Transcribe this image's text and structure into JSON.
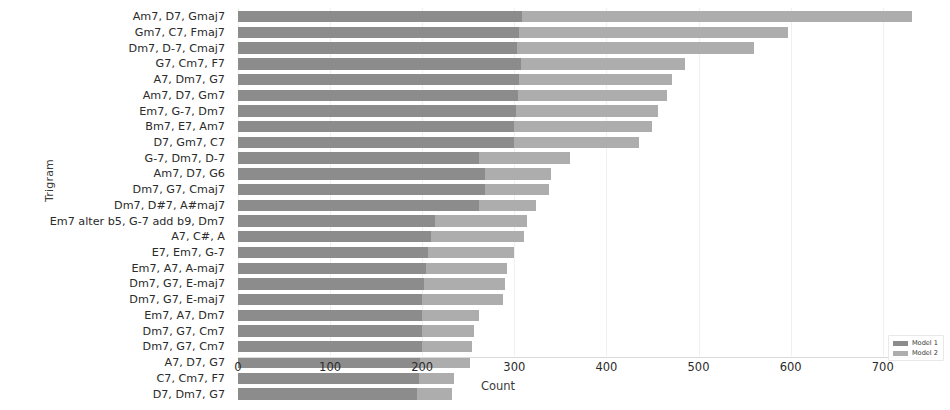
{
  "chart_data": {
    "type": "bar",
    "orientation": "horizontal",
    "stacked": true,
    "title": "",
    "xlabel": "Count",
    "ylabel": "Trigram",
    "xlim": [
      0,
      760
    ],
    "xticks": [
      0,
      100,
      200,
      300,
      400,
      500,
      600,
      700
    ],
    "xtick_labels": [
      "0",
      "100",
      "200",
      "300",
      "400",
      "500",
      "600",
      "700"
    ],
    "grid": true,
    "legend_position": "lower right",
    "categories": [
      "Am7, D7, Gmaj7",
      "Gm7, C7, Fmaj7",
      "Dm7, D-7, Cmaj7",
      "G7, Cm7, F7",
      "A7, Dm7, G7",
      "Am7, D7, Gm7",
      "Em7, G-7, Dm7",
      "Bm7, E7, Am7",
      "D7, Gm7, C7",
      "G-7, Dm7, D-7",
      "Am7, D7, G6",
      "Dm7, G7, Cmaj7",
      "Dm7, D#7, A#maj7",
      "Em7 alter b5, G-7 add b9, Dm7",
      "A7, C#, A",
      "E7, Em7, G-7",
      "Em7, A7, A-maj7",
      "Dm7, G7, E-maj7",
      "Dm7, G7, E-maj7",
      "Em7, A7, Dm7",
      "Dm7, G7, Cm7",
      "Dm7, G7, Cm7",
      "A7, D7, G7",
      "C7, Cm7, F7",
      "D7, Dm7, G7"
    ],
    "series": [
      {
        "name": "Model 1",
        "color": "#8c8c8c",
        "values": [
          308,
          305,
          303,
          307,
          305,
          304,
          302,
          300,
          300,
          262,
          268,
          268,
          262,
          214,
          210,
          206,
          204,
          202,
          200,
          200,
          200,
          200,
          198,
          196,
          194
        ]
      },
      {
        "name": "Model 2",
        "color": "#adadad",
        "values": [
          424,
          292,
          257,
          178,
          166,
          162,
          154,
          150,
          135,
          98,
          72,
          70,
          62,
          100,
          100,
          94,
          88,
          88,
          88,
          62,
          56,
          54,
          54,
          38,
          38
        ]
      }
    ],
    "totals": [
      732,
      597,
      560,
      485,
      471,
      466,
      456,
      450,
      435,
      360,
      340,
      338,
      324,
      314,
      310,
      300,
      292,
      290,
      288,
      262,
      256,
      254,
      252,
      234,
      232
    ]
  },
  "legend": {
    "items": [
      {
        "label": "Model 1",
        "color": "#8c8c8c"
      },
      {
        "label": "Model 2",
        "color": "#adadad"
      }
    ]
  }
}
